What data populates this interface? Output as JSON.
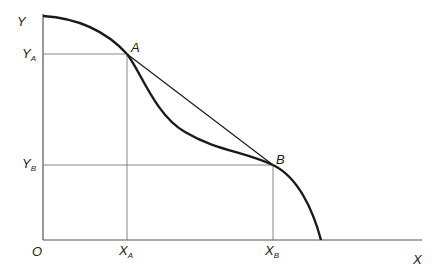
{
  "figure": {
    "axes": {
      "x_label": "X",
      "y_label": "Y",
      "origin_label": "O"
    },
    "points": {
      "a": {
        "label": "A"
      },
      "b": {
        "label": "B"
      }
    },
    "ticks": {
      "x_a": {
        "main": "X",
        "sub": "A"
      },
      "x_b": {
        "main": "X",
        "sub": "B"
      },
      "y_a": {
        "main": "Y",
        "sub": "A"
      },
      "y_b": {
        "main": "Y",
        "sub": "B"
      }
    },
    "colors": {
      "curve": "#1a1a1a",
      "axis": "#555555",
      "guide": "#777777"
    }
  }
}
